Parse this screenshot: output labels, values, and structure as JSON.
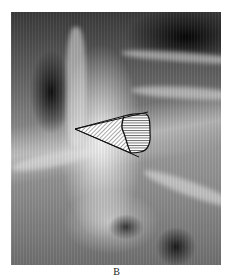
{
  "figure": {
    "label": "B",
    "image_description": "Frontal radiograph of the lumbar spine with a hatched wedge diagram overlay",
    "overlay": {
      "shape": "wedge",
      "left_region_pattern": "diagonal-hatching",
      "right_region_pattern": "horizontal-hatching",
      "stroke_color": "#111111",
      "fill_color": "#ffffff"
    }
  }
}
